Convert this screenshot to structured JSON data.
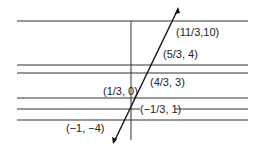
{
  "diagram": {
    "type": "line-graph",
    "points": [
      {
        "label": "(11/3, 10)",
        "x": "11/3",
        "y": 10
      },
      {
        "label": "(5/3, 4)",
        "x": "5/3",
        "y": 4
      },
      {
        "label": "(4/3, 3)",
        "x": "4/3",
        "y": 3
      },
      {
        "label": "(1/3, 0)",
        "x": "1/3",
        "y": 0
      },
      {
        "label": "(−1/3, 1)",
        "x": "−1/3",
        "y": 1
      },
      {
        "label": "(−1, −4)",
        "x": "−1",
        "y": -4
      }
    ]
  },
  "labels": {
    "p1": "(11/3,10)",
    "p2": "(5/3, 4)",
    "p3": "(4/3, 3)",
    "p4": "(1/3, 0)",
    "p5": "(−1/3, 1)",
    "p6": "(−1, −4)"
  }
}
